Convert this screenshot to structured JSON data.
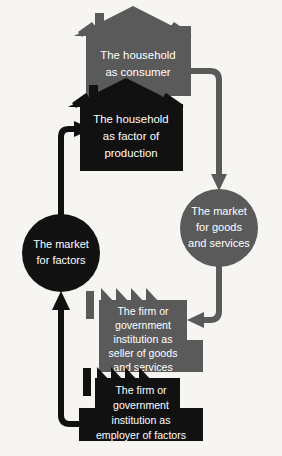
{
  "diagram": {
    "background_color": "#f7f5f2",
    "palette": {
      "dark": "#111111",
      "gray": "#5a5a5a",
      "text": "#ffffff"
    },
    "nodes": [
      {
        "id": "household-consumer",
        "shape": "house",
        "color": "#5a5a5a",
        "lines": [
          "The household",
          "as consumer"
        ]
      },
      {
        "id": "household-factor",
        "shape": "house",
        "color": "#111111",
        "lines": [
          "The household",
          "as factor of",
          "production"
        ]
      },
      {
        "id": "market-goods-services",
        "shape": "circle",
        "color": "#5a5a5a",
        "lines": [
          "The market",
          "for goods",
          "and services"
        ]
      },
      {
        "id": "market-factors",
        "shape": "circle",
        "color": "#111111",
        "lines": [
          "The market",
          "for factors"
        ]
      },
      {
        "id": "firm-seller",
        "shape": "factory",
        "color": "#5a5a5a",
        "lines": [
          "The firm or",
          "government",
          "institution as",
          "seller of goods",
          "and services"
        ]
      },
      {
        "id": "firm-employer",
        "shape": "factory",
        "color": "#111111",
        "lines": [
          "The firm or",
          "government",
          "institution as",
          "employer of factors"
        ]
      }
    ],
    "connectors": [
      {
        "id": "consumer-to-goods-market",
        "color": "#5a5a5a",
        "from": "household-consumer",
        "to": "market-goods-services"
      },
      {
        "id": "goods-market-to-firm-seller",
        "color": "#5a5a5a",
        "from": "market-goods-services",
        "to": "firm-seller"
      },
      {
        "id": "firm-employer-to-factor-market",
        "color": "#111111",
        "from": "firm-employer",
        "to": "market-factors"
      },
      {
        "id": "factor-market-to-household-factor",
        "color": "#111111",
        "from": "market-factors",
        "to": "household-factor"
      }
    ]
  }
}
